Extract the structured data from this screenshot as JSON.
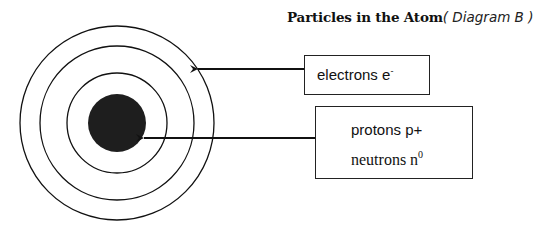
{
  "title": {
    "main": "Particles in the Atom",
    "sub": "( Diagram B )"
  },
  "diagram": {
    "center": [
      117,
      123
    ],
    "shell_radii": [
      97,
      77,
      50
    ],
    "nucleus_radius": 29,
    "nucleus_color": "#1e1e1e",
    "line_color": "#111111"
  },
  "labels": {
    "electrons": {
      "text": "electrons  e",
      "superscript": "-"
    },
    "protons": {
      "text": "protons p+"
    },
    "neutrons": {
      "text": "neutrons n",
      "superscript": "0"
    }
  },
  "arrows": [
    {
      "name": "electrons-arrow",
      "from": [
        304,
        69
      ],
      "to": [
        196,
        69
      ]
    },
    {
      "name": "nucleus-arrow",
      "from": [
        315,
        138
      ],
      "to": [
        142,
        138
      ]
    }
  ]
}
